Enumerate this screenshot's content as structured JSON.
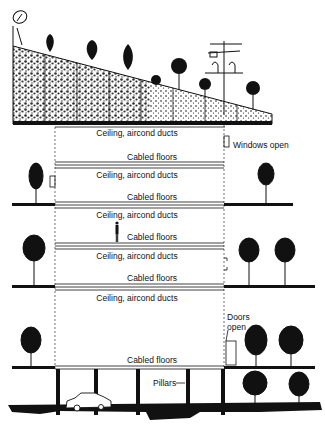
{
  "diagram": {
    "type": "building-section",
    "colors": {
      "ink": "#111111",
      "paper": "#ffffff",
      "rule": "#444444"
    },
    "labels": {
      "ceiling_1": "Ceiling, aircond  ducts",
      "cabled_1": "Cabled floors",
      "ceiling_2": "Ceiling, aircond  ducts",
      "cabled_2": "Cabled floors",
      "ceiling_3": "Ceiling, aircond  ducts",
      "cabled_3": "Cabled floors",
      "ceiling_4": "Ceiling, aircond  ducts",
      "cabled_4": "Cabled floors",
      "ceiling_5": "Ceiling, aircond  ducts",
      "cabled_5": "Cabled floors",
      "windows_open": "Windows open",
      "doors_open_line1": "Doors",
      "doors_open_line2": "open",
      "pillars": "Pillars"
    },
    "elements": {
      "roof": "sloped-planted-roof",
      "satellite_dish": "satellite-dish-icon",
      "antenna": "tv-antenna-icon",
      "car": "car-icon",
      "person": "person-icon",
      "trees": "tree-icon"
    }
  }
}
